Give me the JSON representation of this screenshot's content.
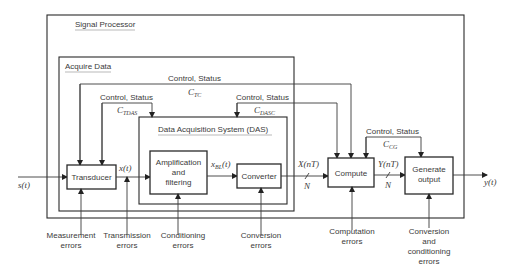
{
  "frames": {
    "signal_processor": "Signal Processor",
    "acquire_data": "Acquire Data",
    "das": "Data Acquisition System (DAS)"
  },
  "blocks": {
    "transducer": "Transducer",
    "amp_line1": "Amplification",
    "amp_line2": "and",
    "amp_line3": "filtering",
    "converter": "Converter",
    "compute": "Compute",
    "generate_line1": "Generate",
    "generate_line2": "output"
  },
  "signals": {
    "input": "s(t)",
    "x_t": "x(t)",
    "x_bl_base": "x",
    "x_bl_sub": "BL",
    "x_bl_arg": "(t)",
    "X_nT": "X(nT)",
    "Y_nT": "Y(nT)",
    "N1": "N",
    "N2": "N",
    "output": "y(t)"
  },
  "control": {
    "label": "Control, Status",
    "c_tc_base": "C",
    "c_tc_sub": "TC",
    "c_tdas_base": "C",
    "c_tdas_sub": "TDAS",
    "c_dasc_base": "C",
    "c_dasc_sub": "DASC",
    "c_cg_base": "C",
    "c_cg_sub": "CG"
  },
  "errors": {
    "measurement_1": "Measurement",
    "measurement_2": "errors",
    "transmission_1": "Transmission",
    "transmission_2": "errors",
    "conditioning_1": "Conditioning",
    "conditioning_2": "errors",
    "conversion_1": "Conversion",
    "conversion_2": "errors",
    "computation_1": "Computation",
    "computation_2": "errors",
    "convcond_1": "Conversion",
    "convcond_2": "and",
    "convcond_3": "conditioning",
    "convcond_4": "errors"
  }
}
